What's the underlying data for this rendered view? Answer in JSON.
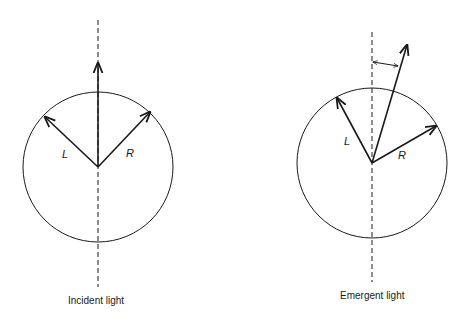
{
  "figure": {
    "panels": [
      {
        "id": "incident",
        "caption": "Incident light",
        "vector_labels": {
          "left": "L",
          "right": "R"
        },
        "description": "Equal L and R circular components, resultant vertical along dashed axis"
      },
      {
        "id": "emergent",
        "caption": "Emergent light",
        "vector_labels": {
          "left": "L",
          "right": "R"
        },
        "description": "Unequal L and R components, resultant rotated from dashed axis; rotation angle marked by double-headed arrow"
      }
    ],
    "colors": {
      "line": "#1a1a1a",
      "background": "#ffffff"
    }
  }
}
